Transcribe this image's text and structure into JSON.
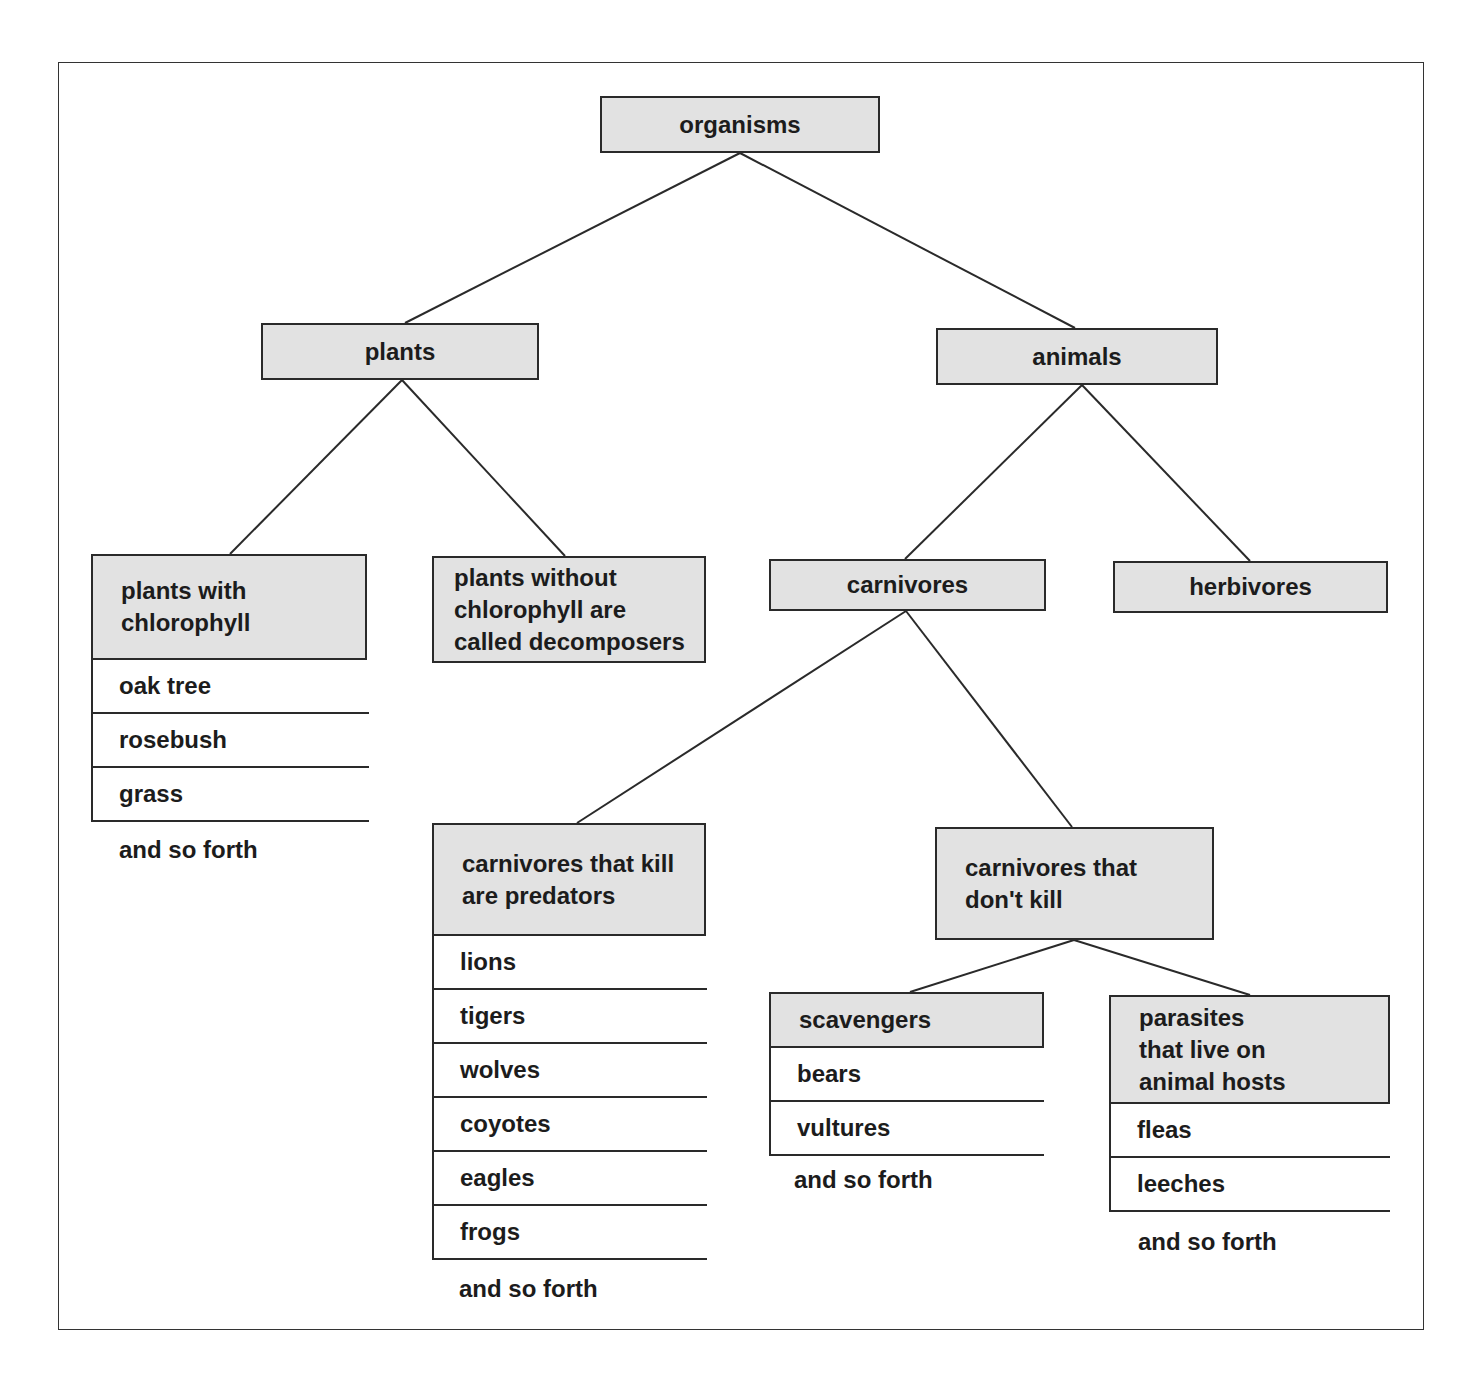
{
  "diagram": {
    "root": {
      "label": "organisms"
    },
    "level1": {
      "plants": {
        "label": "plants"
      },
      "animals": {
        "label": "animals"
      }
    },
    "plants_branch": {
      "with_chlorophyll": {
        "label": "plants with\nchlorophyll",
        "examples": [
          "oak tree",
          "rosebush",
          "grass"
        ],
        "more": "and so forth"
      },
      "without_chlorophyll": {
        "label": "plants without\nchlorophyll are\ncalled decomposers"
      }
    },
    "animals_branch": {
      "carnivores": {
        "label": "carnivores"
      },
      "herbivores": {
        "label": "herbivores"
      }
    },
    "carnivores_branch": {
      "predators": {
        "label": "carnivores that kill\nare predators",
        "examples": [
          "lions",
          "tigers",
          "wolves",
          "coyotes",
          "eagles",
          "frogs"
        ],
        "more": "and so forth"
      },
      "non_killers": {
        "label": "carnivores that\ndon't kill"
      }
    },
    "non_killers_branch": {
      "scavengers": {
        "label": "scavengers",
        "examples": [
          "bears",
          "vultures"
        ],
        "more": "and so forth"
      },
      "parasites": {
        "label": "parasites\nthat live on\nanimal hosts",
        "examples": [
          "fleas",
          "leeches"
        ],
        "more": "and so forth"
      }
    },
    "colors": {
      "node_fill": "#e2e2e2",
      "stroke": "#2a2a2a",
      "text": "#1c1c1c"
    }
  }
}
